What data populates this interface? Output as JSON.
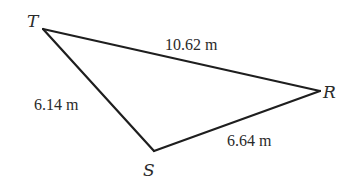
{
  "figure": {
    "type": "triangle",
    "vertices": [
      {
        "id": "T",
        "label": "T",
        "x": 43,
        "y": 29,
        "label_x": 27,
        "label_y": 27
      },
      {
        "id": "R",
        "label": "R",
        "x": 320,
        "y": 91,
        "label_x": 323,
        "label_y": 98
      },
      {
        "id": "S",
        "label": "S",
        "x": 154,
        "y": 151,
        "label_x": 143,
        "label_y": 176
      }
    ],
    "sides": [
      {
        "from": "T",
        "to": "R",
        "label": "10.62 m",
        "label_x": 165,
        "label_y": 50
      },
      {
        "from": "T",
        "to": "S",
        "label": "6.14 m",
        "label_x": 34,
        "label_y": 110
      },
      {
        "from": "S",
        "to": "R",
        "label": "6.64 m",
        "label_x": 227,
        "label_y": 146
      }
    ],
    "colors": {
      "stroke": "#1e1e1e",
      "text": "#2a2a2a",
      "background": "#ffffff"
    }
  }
}
